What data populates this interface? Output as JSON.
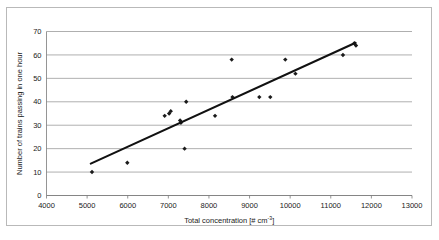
{
  "chart_data": {
    "type": "scatter",
    "title": "",
    "xlabel": "Total concentration [# cm-3]",
    "xlabel_main": "Total concentration [# cm",
    "xlabel_sup": "-3",
    "xlabel_tail": "]",
    "ylabel": "Number of trains passing in one hour",
    "xlim": [
      4000,
      13000
    ],
    "ylim": [
      0,
      70
    ],
    "xticks": [
      4000,
      5000,
      6000,
      7000,
      8000,
      9000,
      10000,
      11000,
      12000,
      13000
    ],
    "yticks": [
      0,
      10,
      20,
      30,
      40,
      50,
      60,
      70
    ],
    "grid": "horizontal",
    "legend": "none",
    "marker": "diamond",
    "marker_color": "#1b1b1b",
    "points": [
      {
        "x": 5120,
        "y": 10
      },
      {
        "x": 5990,
        "y": 14
      },
      {
        "x": 6910,
        "y": 34
      },
      {
        "x": 7020,
        "y": 35
      },
      {
        "x": 7060,
        "y": 36
      },
      {
        "x": 7290,
        "y": 32
      },
      {
        "x": 7310,
        "y": 31
      },
      {
        "x": 7400,
        "y": 20
      },
      {
        "x": 7440,
        "y": 40
      },
      {
        "x": 8150,
        "y": 34
      },
      {
        "x": 8560,
        "y": 58
      },
      {
        "x": 8580,
        "y": 42
      },
      {
        "x": 9240,
        "y": 42
      },
      {
        "x": 9510,
        "y": 42
      },
      {
        "x": 9880,
        "y": 58
      },
      {
        "x": 10130,
        "y": 52
      },
      {
        "x": 11300,
        "y": 60
      },
      {
        "x": 11580,
        "y": 65
      },
      {
        "x": 11620,
        "y": 64
      }
    ],
    "trendline": {
      "type": "linear",
      "x_start": 5090,
      "y_start": 13.6,
      "x_end": 11610,
      "y_end": 65.2,
      "color": "#111111"
    }
  }
}
